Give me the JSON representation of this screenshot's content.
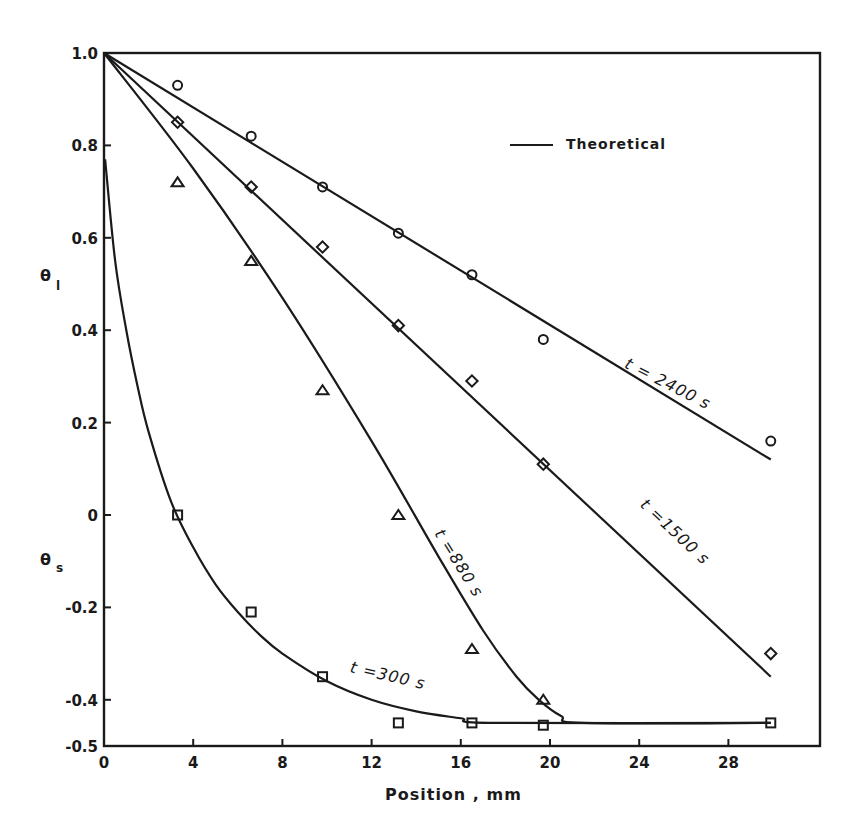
{
  "chart_data": {
    "type": "line",
    "title": "",
    "xlabel": "Position , mm",
    "ylabel_top": "θl",
    "ylabel_bottom": "θs",
    "xlim": [
      0,
      32
    ],
    "ylim": [
      -0.5,
      1.0
    ],
    "x_ticks": [
      0,
      4,
      8,
      12,
      16,
      20,
      24,
      28
    ],
    "y_ticks": [
      1.0,
      0.8,
      0.6,
      0.4,
      0.2,
      0,
      -0.2,
      -0.4,
      -0.5
    ],
    "x_tick_labels": [
      "0",
      "4",
      "8",
      "12",
      "16",
      "20",
      "24",
      "28"
    ],
    "y_tick_labels": [
      "1.0",
      "0.8",
      "0.6",
      "0.4",
      "0.2",
      "0",
      "-0.2",
      "-0.4",
      "-0.5"
    ],
    "grid": false,
    "legend": {
      "position": "top-right",
      "entries": [
        {
          "label": "Theoretical",
          "style": "solid-line"
        }
      ]
    },
    "series": [
      {
        "name": "t=2400 s",
        "marker": "circle",
        "label": "t = 2400  s",
        "theory": [
          [
            0,
            1.0
          ],
          [
            29.9,
            0.12
          ]
        ],
        "points": [
          [
            3.3,
            0.93
          ],
          [
            6.6,
            0.82
          ],
          [
            9.8,
            0.71
          ],
          [
            13.2,
            0.61
          ],
          [
            16.5,
            0.52
          ],
          [
            19.7,
            0.38
          ],
          [
            29.9,
            0.16
          ]
        ]
      },
      {
        "name": "t=1500 s",
        "marker": "diamond",
        "label": "t =1500  s",
        "theory": [
          [
            0,
            1.0
          ],
          [
            29.9,
            -0.35
          ]
        ],
        "points": [
          [
            3.3,
            0.85
          ],
          [
            6.6,
            0.71
          ],
          [
            9.8,
            0.58
          ],
          [
            13.2,
            0.41
          ],
          [
            16.5,
            0.29
          ],
          [
            19.7,
            0.11
          ],
          [
            29.9,
            -0.3
          ]
        ]
      },
      {
        "name": "t=880 s",
        "marker": "triangle",
        "label": "t =880  s",
        "theory": [
          [
            0,
            1.0
          ],
          [
            4,
            0.75
          ],
          [
            8,
            0.47
          ],
          [
            12,
            0.16
          ],
          [
            15,
            -0.09
          ],
          [
            17,
            -0.25
          ],
          [
            18.5,
            -0.35
          ],
          [
            19.5,
            -0.4
          ],
          [
            20.5,
            -0.435
          ],
          [
            21.5,
            -0.45
          ],
          [
            29.9,
            -0.45
          ]
        ],
        "points": [
          [
            3.3,
            0.72
          ],
          [
            6.6,
            0.55
          ],
          [
            9.8,
            0.27
          ],
          [
            13.2,
            0.0
          ],
          [
            16.5,
            -0.29
          ],
          [
            19.7,
            -0.4
          ]
        ]
      },
      {
        "name": "t=300 s",
        "marker": "square",
        "label": "t =300  s",
        "theory": [
          [
            0.05,
            0.77
          ],
          [
            0.5,
            0.55
          ],
          [
            1.0,
            0.4
          ],
          [
            1.5,
            0.28
          ],
          [
            2.0,
            0.18
          ],
          [
            3.0,
            0.03
          ],
          [
            4.0,
            -0.07
          ],
          [
            5.0,
            -0.15
          ],
          [
            6.0,
            -0.21
          ],
          [
            7.0,
            -0.26
          ],
          [
            8.0,
            -0.3
          ],
          [
            10.0,
            -0.36
          ],
          [
            12.0,
            -0.4
          ],
          [
            14.0,
            -0.425
          ],
          [
            16.0,
            -0.44
          ],
          [
            17.5,
            -0.45
          ],
          [
            29.9,
            -0.45
          ]
        ],
        "points": [
          [
            3.3,
            0.0
          ],
          [
            6.6,
            -0.21
          ],
          [
            9.8,
            -0.35
          ],
          [
            13.2,
            -0.45
          ],
          [
            16.5,
            -0.45
          ],
          [
            19.7,
            -0.455
          ],
          [
            29.9,
            -0.45
          ]
        ]
      }
    ],
    "annotations": [
      {
        "text": "t = 2400  s",
        "x": 23.3,
        "y": 0.32,
        "rotation": 27
      },
      {
        "text": "t =1500  s",
        "x": 24.0,
        "y": 0.02,
        "rotation": 43
      },
      {
        "text": "t =880  s",
        "x": 14.8,
        "y": -0.04,
        "rotation": 58
      },
      {
        "text": "t =300  s",
        "x": 11.0,
        "y": -0.34,
        "rotation": 13
      }
    ]
  },
  "labels": {
    "xlabel": "Position , mm",
    "ylabel_theta": "θ",
    "ylabel_l_sub": "l",
    "ylabel_s_sub": "s",
    "legend_theoretical": "Theoretical"
  }
}
